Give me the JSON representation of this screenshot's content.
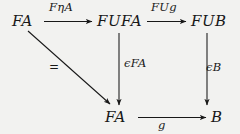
{
  "diagram": {
    "kind": "commutative-diagram",
    "background_color": "#f2f2f0",
    "ink_color": "#181818",
    "nodes": [
      {
        "id": "fa-top-left",
        "label": "FA",
        "x": 12,
        "y": 14
      },
      {
        "id": "fufa",
        "label": "FUFA",
        "x": 97,
        "y": 14
      },
      {
        "id": "fub",
        "label": "FUB",
        "x": 191,
        "y": 14
      },
      {
        "id": "fa-bottom",
        "label": "FA",
        "x": 105,
        "y": 110
      },
      {
        "id": "b",
        "label": "B",
        "x": 211,
        "y": 110
      }
    ],
    "edges": [
      {
        "id": "top-left",
        "label": "FηA",
        "from": "fa-top-left",
        "to": "fufa",
        "direction": "right"
      },
      {
        "id": "top-right",
        "label": "FUg",
        "from": "fufa",
        "to": "fub",
        "direction": "right"
      },
      {
        "id": "mid-vertical",
        "label": "ϵFA",
        "from": "fufa",
        "to": "fa-bottom",
        "direction": "down"
      },
      {
        "id": "right-vertical",
        "label": "ϵB",
        "from": "fub",
        "to": "b",
        "direction": "down"
      },
      {
        "id": "bottom",
        "label": "g",
        "from": "fa-bottom",
        "to": "b",
        "direction": "right"
      },
      {
        "id": "diagonal",
        "label": "=",
        "from": "fa-top-left",
        "to": "fa-bottom",
        "direction": "down-right"
      }
    ]
  }
}
